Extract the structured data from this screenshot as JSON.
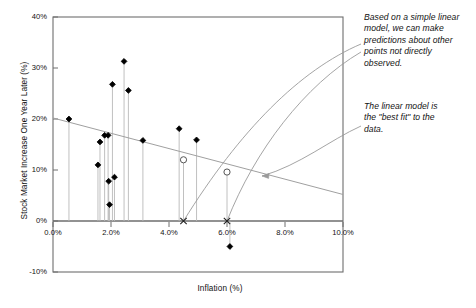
{
  "chart_data": {
    "type": "scatter",
    "title": "",
    "xlabel": "Inflation (%)",
    "ylabel": "Stock Market Increase One Year Later (%)",
    "xlim": [
      0,
      10
    ],
    "ylim": [
      -10,
      40
    ],
    "xticks": [
      0,
      2,
      4,
      6,
      8,
      10
    ],
    "xticklabels": [
      "0.0%",
      "2.0%",
      "4.0%",
      "6.0%",
      "8.0%",
      "10.0%"
    ],
    "yticks": [
      -10,
      0,
      10,
      20,
      30,
      40
    ],
    "yticklabels": [
      "-10%",
      "0%",
      "10%",
      "20%",
      "30%",
      "40%"
    ],
    "grid": false,
    "legend": null,
    "series": [
      {
        "name": "Observed data",
        "marker": "filled-diamond",
        "droplines": true,
        "points": [
          {
            "x": 0.55,
            "y": 20.0
          },
          {
            "x": 1.55,
            "y": 11.0
          },
          {
            "x": 1.62,
            "y": 15.5
          },
          {
            "x": 1.78,
            "y": 16.8
          },
          {
            "x": 1.9,
            "y": 16.8
          },
          {
            "x": 1.92,
            "y": 7.8
          },
          {
            "x": 1.95,
            "y": 3.2
          },
          {
            "x": 2.05,
            "y": 26.8
          },
          {
            "x": 2.12,
            "y": 8.6
          },
          {
            "x": 2.45,
            "y": 31.3
          },
          {
            "x": 2.6,
            "y": 25.6
          },
          {
            "x": 3.1,
            "y": 15.8
          },
          {
            "x": 4.35,
            "y": 18.1
          },
          {
            "x": 4.95,
            "y": 15.9
          },
          {
            "x": 6.1,
            "y": -5.0
          }
        ]
      },
      {
        "name": "Predicted points",
        "marker": "open-circle",
        "droplines": true,
        "points": [
          {
            "x": 4.5,
            "y": 12.0
          },
          {
            "x": 6.0,
            "y": 9.6
          }
        ]
      },
      {
        "name": "Prediction x-markers",
        "marker": "x",
        "points": [
          {
            "x": 4.5,
            "y": 0
          },
          {
            "x": 6.0,
            "y": 0
          }
        ]
      }
    ],
    "trendline": {
      "name": "Linear model (best fit)",
      "x0": 0.0,
      "y0": 20.2,
      "x1": 10.0,
      "y1": 5.2
    },
    "annotations": [
      {
        "id": "annot-0",
        "text": "Based on a simple linear\nmodel, we can make\npredictions about other\npoints not directly\nobserved.",
        "target": "prediction-points"
      },
      {
        "id": "annot-1",
        "text": "The linear model is\nthe \"best fit\" to the\ndata.",
        "target": "trendline"
      }
    ]
  },
  "colors": {
    "axis": "#6e6e6e",
    "marker": "#000000",
    "dropline": "#b9b9b9",
    "trendline": "#a0a0a0",
    "leader": "#9a9a9a",
    "text": "#111111",
    "background": "#ffffff"
  }
}
